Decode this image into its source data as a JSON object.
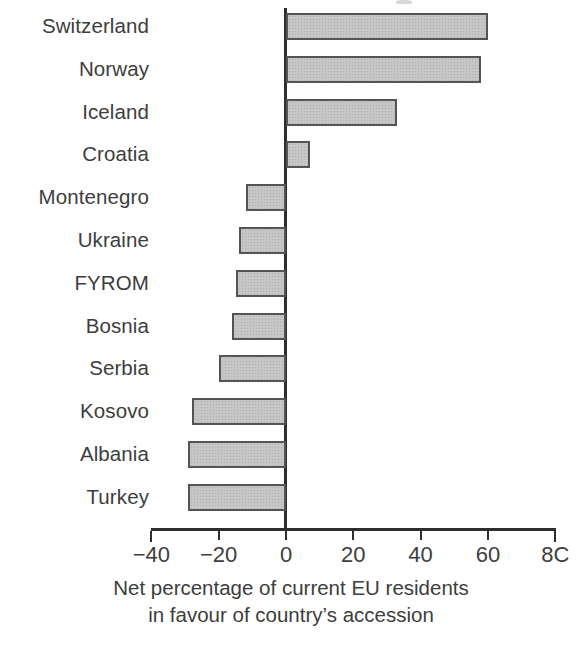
{
  "chart_data": {
    "type": "bar",
    "orientation": "horizontal",
    "title": "",
    "xlabel": "Net percentage of current EU residents in favour of country's accession",
    "xlabel_line1": "Net percentage of current EU residents",
    "xlabel_line2": "in favour of country’s accession",
    "ylabel": "",
    "categories": [
      "Switzerland",
      "Norway",
      "Iceland",
      "Croatia",
      "Montenegro",
      "Ukraine",
      "FYROM",
      "Bosnia",
      "Serbia",
      "Kosovo",
      "Albania",
      "Turkey"
    ],
    "values": [
      60,
      58,
      33,
      7,
      -12,
      -14,
      -15,
      -16,
      -20,
      -28,
      -29,
      -29
    ],
    "xlim": [
      -40,
      80
    ],
    "xticks": [
      -40,
      -20,
      0,
      20,
      40,
      60,
      80
    ],
    "xtick_labels": [
      "−40",
      "−20",
      "0",
      "20",
      "40",
      "60",
      "8C"
    ],
    "grid": false,
    "legend": false,
    "bar_fill_color": "#c6c6c6",
    "bar_edge_color": "#545454",
    "axis_color": "#2e2e2e",
    "text_color": "#3d3d3d",
    "background_color": "#ffffff",
    "note": "Rightmost tick label is clipped at the image edge; it reads 80 but renders as “8C”."
  }
}
